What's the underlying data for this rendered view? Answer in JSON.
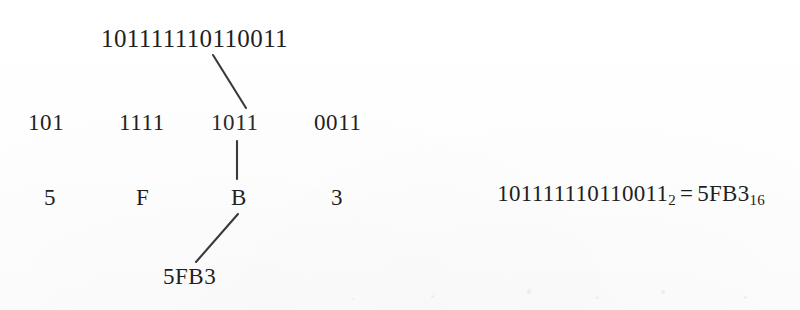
{
  "diagram": {
    "top_binary": "101111110110011",
    "groups": [
      "101",
      "1111",
      "1011",
      "0011"
    ],
    "hex_digits": [
      "5",
      "F",
      "B",
      "3"
    ],
    "result": "5FB3",
    "connector_color": "#3a3a3a"
  },
  "equation": {
    "binary_value": "101111110110011",
    "binary_base": "2",
    "operator": "=",
    "hex_value": "5FB3",
    "hex_base": "16"
  }
}
